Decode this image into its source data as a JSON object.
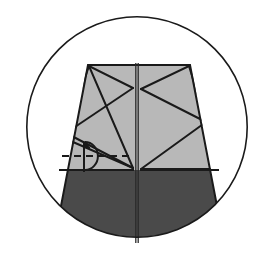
{
  "figure": {
    "name": "circular-origami-crease-pattern-diagram",
    "canvas": {
      "width": 273,
      "height": 254,
      "background": "#ffffff"
    },
    "colors": {
      "background": "#ffffff",
      "outline": "#1a1a1a",
      "light_panel": "#b8b8b8",
      "dark_panel": "#4a4a4a",
      "crease_line": "#1a1a1a",
      "center_line": "#2a2a2a",
      "annotation": "#1a1a1a"
    },
    "circle_boundary": {
      "name": "enclosing-circle",
      "center_x": 137,
      "center_y": 127,
      "radius": 111,
      "stroke_width": 1.6,
      "fill": "#ffffff"
    },
    "frustum": {
      "name": "truncated-cone-body",
      "top_left_x": 88,
      "top_right_x": 190,
      "top_y": 65,
      "bottom_left_x": 56,
      "bottom_right_x": 222,
      "bottom_y": 232,
      "split_y": 170,
      "upper_fill": "#b8b8b8",
      "lower_fill": "#4a4a4a"
    },
    "center_seam": {
      "name": "vertical-center-seam",
      "x": 137,
      "top_y": 63,
      "bottom_y": 243,
      "gap": 2.4,
      "stroke_width": 1.3
    },
    "crease_lines": [
      {
        "name": "crease-left-top-to-mid-left",
        "x1": 89,
        "y1": 66,
        "x2": 66,
        "y2": 133
      },
      {
        "name": "crease-left-top-to-center-apex",
        "x1": 89,
        "y1": 66,
        "x2": 133,
        "y2": 88
      },
      {
        "name": "crease-mid-left-to-center-apex",
        "x1": 66,
        "y1": 133,
        "x2": 133,
        "y2": 88
      },
      {
        "name": "crease-left-top-to-lower-center",
        "x1": 89,
        "y1": 66,
        "x2": 133,
        "y2": 168
      },
      {
        "name": "crease-mid-left-to-lower-center",
        "x1": 66,
        "y1": 133,
        "x2": 133,
        "y2": 168
      },
      {
        "name": "crease-mid-left-to-lower-center-second",
        "x1": 66,
        "y1": 139,
        "x2": 133,
        "y2": 168
      },
      {
        "name": "crease-right-top-to-center-apex",
        "x1": 189,
        "y1": 66,
        "x2": 141,
        "y2": 89
      },
      {
        "name": "crease-right-top-to-mid-right",
        "x1": 189,
        "y1": 66,
        "x2": 206,
        "y2": 122
      },
      {
        "name": "crease-center-apex-to-mid-right",
        "x1": 141,
        "y1": 89,
        "x2": 206,
        "y2": 122
      },
      {
        "name": "crease-mid-right-to-lower-right",
        "x1": 206,
        "y1": 122,
        "x2": 141,
        "y2": 169
      },
      {
        "name": "crease-lower-right-to-edge",
        "x1": 141,
        "y1": 169,
        "x2": 213,
        "y2": 169
      },
      {
        "name": "crease-horizontal-split-left",
        "x1": 59,
        "y1": 170,
        "x2": 134,
        "y2": 170
      },
      {
        "name": "crease-horizontal-split-right",
        "x1": 140,
        "y1": 170,
        "x2": 219,
        "y2": 170
      }
    ],
    "annotation": {
      "name": "rotation-symmetry-marker",
      "center_x": 84,
      "center_y": 156,
      "arc_radius": 11,
      "dashed_line": {
        "name": "dashed-axis-line",
        "x1": 62,
        "y1": 156,
        "x2": 134,
        "y2": 156,
        "dash": "7,5"
      },
      "vertical_tick": {
        "name": "axis-vertical-tick",
        "x": 84,
        "y1": 142,
        "y2": 172
      },
      "arrow": {
        "name": "rotation-arrow-head",
        "tip_x": 90,
        "tip_y": 138
      }
    }
  }
}
